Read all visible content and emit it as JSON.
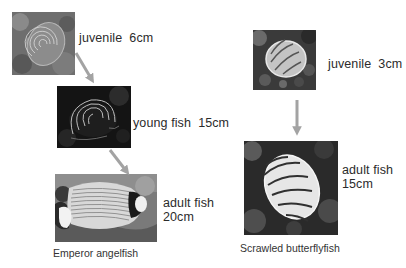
{
  "diagram": {
    "colors": {
      "arrow": "#a3a3a3",
      "text": "#2b2b2b",
      "background": "#ffffff"
    },
    "species": [
      {
        "name": "Emperor angelfish",
        "stages": [
          {
            "label": "juvenile  6cm",
            "image": "juvenile-emperor-angelfish-photo"
          },
          {
            "label": "young fish  15cm",
            "image": "young-emperor-angelfish-photo"
          },
          {
            "label_line1": "adult fish",
            "label_line2": "20cm",
            "image": "adult-emperor-angelfish-photo"
          }
        ]
      },
      {
        "name": "Scrawled butterflyfish",
        "stages": [
          {
            "label": "juvenile  3cm",
            "image": "juvenile-scrawled-butterflyfish-photo"
          },
          {
            "label_line1": "adult fish",
            "label_line2": "15cm",
            "image": "adult-scrawled-butterflyfish-photo"
          }
        ]
      }
    ],
    "arrows": [
      {
        "from": "juvenile",
        "to": "young fish",
        "species": "Emperor angelfish"
      },
      {
        "from": "young fish",
        "to": "adult fish",
        "species": "Emperor angelfish"
      },
      {
        "from": "juvenile",
        "to": "adult fish",
        "species": "Scrawled butterflyfish"
      }
    ]
  }
}
